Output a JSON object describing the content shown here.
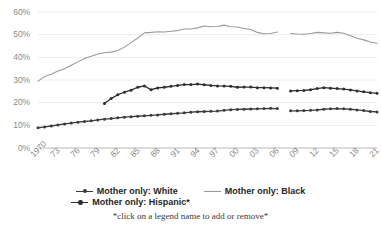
{
  "chart_data": {
    "type": "line",
    "title": "",
    "subtitle": "",
    "xlabel": "",
    "ylabel": "",
    "ylim": [
      0,
      60
    ],
    "ytick_values": [
      0,
      10,
      20,
      30,
      40,
      50,
      60
    ],
    "ytick_labels": [
      "0%",
      "10%",
      "20%",
      "30%",
      "40%",
      "50%",
      "60%"
    ],
    "grid": true,
    "grid_axis": "y",
    "legend_position": "bottom",
    "x": [
      1970,
      1971,
      1972,
      1973,
      1974,
      1975,
      1976,
      1977,
      1978,
      1979,
      1980,
      1981,
      1982,
      1983,
      1984,
      1985,
      1986,
      1987,
      1988,
      1989,
      1990,
      1991,
      1992,
      1993,
      1994,
      1995,
      1996,
      1997,
      1998,
      1999,
      2000,
      2001,
      2002,
      2003,
      2004,
      2005,
      2006,
      2007,
      2008,
      2009,
      2010,
      2011,
      2012,
      2013,
      2014,
      2015,
      2016,
      2017,
      2018,
      2019,
      2020,
      2021
    ],
    "xtick_labels": [
      "1970",
      "73",
      "76",
      "79",
      "82",
      "85",
      "88",
      "91",
      "94",
      "97",
      "00",
      "03",
      "06",
      "09",
      "12",
      "15",
      "18",
      "21"
    ],
    "xtick_years": [
      1970,
      1973,
      1976,
      1979,
      1982,
      1985,
      1988,
      1991,
      1994,
      1997,
      2000,
      2003,
      2006,
      2009,
      2012,
      2015,
      2018,
      2021
    ],
    "series": [
      {
        "name": "Mother only: White",
        "color": "#3b3b3b",
        "marker": "circle",
        "values": [
          8.9,
          9.3,
          9.7,
          10.2,
          10.6,
          11.0,
          11.4,
          11.7,
          12.0,
          12.4,
          12.7,
          13.0,
          13.3,
          13.6,
          13.8,
          14.0,
          14.2,
          14.4,
          14.6,
          14.9,
          15.1,
          15.3,
          15.5,
          15.8,
          16.0,
          16.1,
          16.2,
          16.3,
          16.6,
          16.9,
          17.0,
          17.1,
          17.2,
          17.3,
          17.4,
          17.5,
          17.4,
          null,
          16.4,
          16.4,
          16.5,
          16.6,
          16.8,
          17.1,
          17.3,
          17.4,
          17.3,
          17.1,
          16.8,
          16.5,
          16.1,
          15.9
        ]
      },
      {
        "name": "Mother only: Black",
        "color": "#9a9a9a",
        "marker": "line",
        "values": [
          29.5,
          31.5,
          32.5,
          34.0,
          35.0,
          36.5,
          38.0,
          39.5,
          40.5,
          41.5,
          42.0,
          42.3,
          43.0,
          44.5,
          46.5,
          48.5,
          50.8,
          51.0,
          51.3,
          51.2,
          51.5,
          51.8,
          52.5,
          52.5,
          53.0,
          53.8,
          53.5,
          53.6,
          54.2,
          53.5,
          53.4,
          52.7,
          52.3,
          51.0,
          50.4,
          50.5,
          51.2,
          null,
          50.5,
          50.3,
          50.2,
          50.5,
          51.0,
          50.8,
          50.6,
          51.0,
          50.6,
          49.5,
          48.4,
          47.7,
          46.8,
          46.2
        ]
      },
      {
        "name": "Mother only: Hispanic*",
        "color": "#2e2e2e",
        "marker": "circle",
        "values": [
          null,
          null,
          null,
          null,
          null,
          null,
          null,
          null,
          null,
          null,
          19.6,
          21.8,
          23.5,
          24.6,
          25.5,
          26.8,
          27.4,
          25.7,
          26.5,
          26.8,
          27.2,
          27.6,
          28.0,
          28.0,
          28.2,
          27.9,
          27.6,
          27.4,
          27.3,
          27.2,
          26.8,
          26.9,
          26.9,
          26.6,
          26.6,
          26.5,
          26.4,
          null,
          25.2,
          25.3,
          25.4,
          25.7,
          26.2,
          26.6,
          26.4,
          26.2,
          26.0,
          25.6,
          25.2,
          24.8,
          24.4,
          24.1
        ]
      }
    ],
    "legend": [
      {
        "label": "Mother only: White",
        "color": "#3b3b3b",
        "marker": "circle"
      },
      {
        "label": "Mother only: Black",
        "color": "#9a9a9a",
        "marker": "line"
      },
      {
        "label": "Mother only: Hispanic*",
        "color": "#2e2e2e",
        "marker": "circle"
      }
    ],
    "note": "*click on a legend name to add or remove*"
  }
}
